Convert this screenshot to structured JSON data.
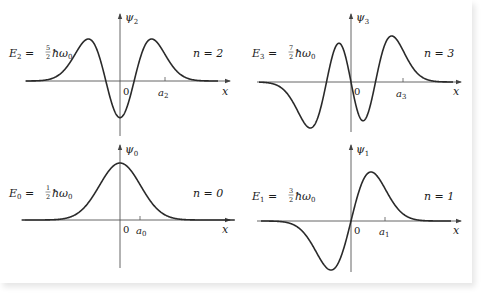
{
  "chart_data": [
    {
      "type": "line",
      "title": "Harmonic oscillator eigenfunction n = 2",
      "panel": "top-left",
      "ylabel": "ψ2",
      "xlabel": "x",
      "energy_label": "E2 = 5/2 ħω0",
      "n_label": "n = 2",
      "ticks": [
        "0",
        "a2"
      ],
      "n": 2,
      "grid": false
    },
    {
      "type": "line",
      "title": "Harmonic oscillator eigenfunction n = 3",
      "panel": "top-right",
      "ylabel": "ψ3",
      "xlabel": "x",
      "energy_label": "E3 = 7/2 ħω0",
      "n_label": "n = 3",
      "ticks": [
        "0",
        "a3"
      ],
      "n": 3,
      "grid": false
    },
    {
      "type": "line",
      "title": "Harmonic oscillator eigenfunction n = 0",
      "panel": "bottom-left",
      "ylabel": "ψ0",
      "xlabel": "x",
      "energy_label": "E0 = 1/2 ħω0",
      "n_label": "n = 0",
      "ticks": [
        "0",
        "a0"
      ],
      "n": 0,
      "grid": false
    },
    {
      "type": "line",
      "title": "Harmonic oscillator eigenfunction n = 1",
      "panel": "bottom-right",
      "ylabel": "ψ1",
      "xlabel": "x",
      "energy_label": "E1 = 3/2 ħω0",
      "n_label": "n = 1",
      "ticks": [
        "0",
        "a1"
      ],
      "n": 1,
      "grid": false
    }
  ],
  "panels": {
    "p2": {
      "E": "E",
      "Esub": "2",
      "num": "5",
      "den": "2",
      "tail": "ħω",
      "tailsub": "0",
      "psi": "ψ",
      "psisub": "2",
      "n": "n = 2",
      "zero": "0",
      "a": "a",
      "asub": "2",
      "x": "x"
    },
    "p3": {
      "E": "E",
      "Esub": "3",
      "num": "7",
      "den": "2",
      "tail": "ħω",
      "tailsub": "0",
      "psi": "ψ",
      "psisub": "3",
      "n": "n = 3",
      "zero": "0",
      "a": "a",
      "asub": "3",
      "x": "x"
    },
    "p0": {
      "E": "E",
      "Esub": "0",
      "num": "1",
      "den": "2",
      "tail": "ħω",
      "tailsub": "0",
      "psi": "ψ",
      "psisub": "0",
      "n": "n = 0",
      "zero": "0",
      "a": "a",
      "asub": "0",
      "x": "x"
    },
    "p1": {
      "E": "E",
      "Esub": "1",
      "num": "3",
      "den": "2",
      "tail": "ħω",
      "tailsub": "0",
      "psi": "ψ",
      "psisub": "1",
      "n": "n = 1",
      "zero": "0",
      "a": "a",
      "asub": "1",
      "x": "x"
    }
  },
  "colors": {
    "curve": "#2a2a2a",
    "axis": "#555555",
    "text": "#1a1a1a"
  }
}
